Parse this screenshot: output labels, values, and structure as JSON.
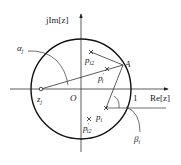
{
  "diagram": {
    "type": "z-plane pole-zero geometry",
    "axes": {
      "x_label": "Re[z]",
      "y_label": "jIm[z]",
      "origin_label": "O",
      "unit_label": "1"
    },
    "unit_circle": true,
    "points": {
      "zero": {
        "label": "z",
        "sub": "j",
        "marker": "circle"
      },
      "A": {
        "label": "A",
        "marker": "point on unit circle"
      },
      "p_i2": {
        "label": "p",
        "sub": "i2",
        "marker": "cross"
      },
      "p_i_prime": {
        "label": "p",
        "sub": "i",
        "sup": "'",
        "marker": "cross"
      },
      "p_i": {
        "label": "p",
        "sub": "i",
        "marker": "cross"
      },
      "p_i2_prime": {
        "label": "p",
        "sub": "i2",
        "sup": "'",
        "marker": "cross"
      }
    },
    "angles": {
      "alpha": {
        "label": "α",
        "sub": "j"
      },
      "beta": {
        "label": "β",
        "sub": "i"
      }
    },
    "colors": {
      "stroke": "#222222",
      "circle": "#111111",
      "background": "#ffffff"
    }
  }
}
